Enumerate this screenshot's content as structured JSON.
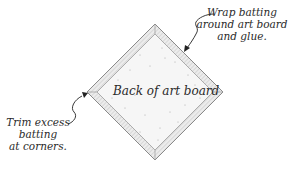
{
  "diagram": {
    "center_label": "Back of art board",
    "callouts": [
      {
        "id": "wrap",
        "lines": [
          "Wrap batting",
          "around art board",
          "and glue."
        ]
      },
      {
        "id": "trim",
        "lines": [
          "Trim excess",
          "batting",
          "at corners."
        ]
      }
    ],
    "colors": {
      "outline": "#8a8a8a",
      "border_fill": "#e2e2e2",
      "board_fill": "#f4f4f4",
      "text": "#2a2a2a",
      "arrow": "#222222"
    }
  }
}
